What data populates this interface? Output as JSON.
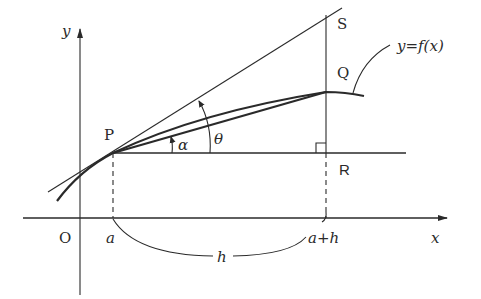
{
  "diagram": {
    "axes": {
      "x_label": "x",
      "y_label": "y",
      "origin_label": "O"
    },
    "points": {
      "P": "P",
      "Q": "Q",
      "R": "R",
      "S": "S"
    },
    "angles": {
      "alpha": "α",
      "theta": "θ"
    },
    "x_ticks": {
      "a": "a",
      "a_plus_h": "a+h"
    },
    "interval_label": "h",
    "curve_label": "y=f(x)",
    "right_angle_marker": "R",
    "colors": {
      "ink": "#2a2a2a",
      "background": "#ffffff"
    }
  }
}
